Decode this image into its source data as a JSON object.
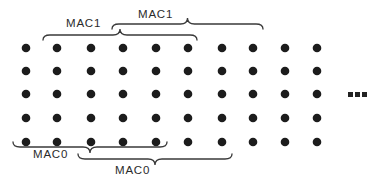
{
  "figure": {
    "background_color": "#ffffff",
    "dot_color": "#1c1c1c",
    "line_color": "#3a3a3a",
    "text_color": "#2b2b2b",
    "grid": {
      "columns_x": [
        26,
        57,
        91,
        123,
        156,
        188,
        222,
        253,
        285,
        317
      ],
      "rows_y": [
        48,
        71,
        94,
        118,
        142
      ],
      "dot_radius": 4.3
    },
    "braces": [
      {
        "label": "MAC1",
        "x1": 43,
        "x2": 197,
        "y": 35,
        "direction": "up",
        "label_x": 66,
        "label_y": 17
      },
      {
        "label": "MAC1",
        "x1": 112,
        "x2": 263,
        "y": 24,
        "direction": "up",
        "label_x": 138,
        "label_y": 8
      },
      {
        "label": "MAC0",
        "x1": 13,
        "x2": 167,
        "y": 147,
        "direction": "down",
        "label_x": 33,
        "label_y": 148
      },
      {
        "label": "MAC0",
        "x1": 78,
        "x2": 232,
        "y": 159,
        "direction": "down",
        "label_x": 115,
        "label_y": 164
      }
    ],
    "ellipsis": {
      "glyph": "...",
      "x": 348,
      "y": 92
    }
  }
}
